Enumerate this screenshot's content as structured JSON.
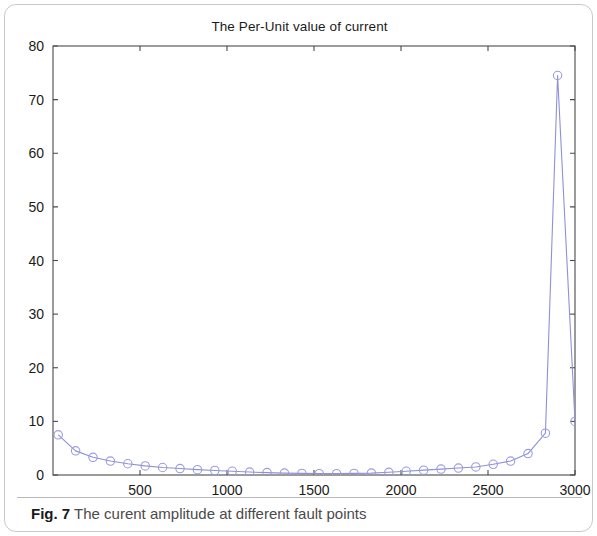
{
  "figure": {
    "caption_label": "Fig. 7",
    "caption_text": "The curent amplitude at different fault points"
  },
  "chart_data": {
    "type": "line",
    "title": "The Per-Unit value of current",
    "xlabel": "",
    "ylabel": "",
    "xlim": [
      0,
      3000
    ],
    "ylim": [
      0,
      80
    ],
    "xticks": [
      500,
      1000,
      1500,
      2000,
      2500,
      3000
    ],
    "yticks": [
      0,
      10,
      20,
      30,
      40,
      50,
      60,
      70,
      80
    ],
    "xtick_labels": [
      "500",
      "1000",
      "1500",
      "2000",
      "2500",
      "3000"
    ],
    "ytick_labels": [
      "0",
      "10",
      "20",
      "30",
      "40",
      "50",
      "60",
      "70",
      "80"
    ],
    "grid": false,
    "legend": null,
    "marker": "circle",
    "line_color": "#8e90d8",
    "marker_color": "#9a9ce0",
    "axis_color": "#4a4a4a",
    "series": [
      {
        "name": "Per-Unit current",
        "x": [
          30,
          130,
          230,
          330,
          430,
          530,
          630,
          730,
          830,
          930,
          1030,
          1130,
          1230,
          1330,
          1430,
          1530,
          1630,
          1730,
          1830,
          1930,
          2030,
          2130,
          2230,
          2330,
          2430,
          2530,
          2630,
          2730,
          2830,
          2900,
          3000
        ],
        "values": [
          7.5,
          4.5,
          3.3,
          2.6,
          2.1,
          1.7,
          1.4,
          1.2,
          1.0,
          0.85,
          0.7,
          0.55,
          0.45,
          0.35,
          0.3,
          0.25,
          0.25,
          0.3,
          0.35,
          0.5,
          0.7,
          0.9,
          1.1,
          1.3,
          1.5,
          2.0,
          2.6,
          4.0,
          7.8,
          74.5,
          10.0
        ]
      }
    ]
  }
}
